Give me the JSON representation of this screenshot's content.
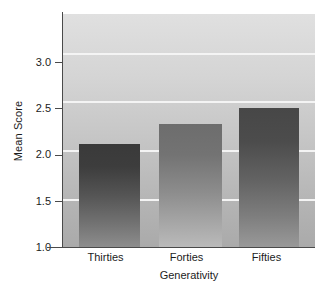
{
  "chart_data": {
    "type": "bar",
    "title": "",
    "subtitle": "",
    "xlabel": "Generativity",
    "ylabel": "Mean Score",
    "categories": [
      "Thirties",
      "Forties",
      "Fifties"
    ],
    "values": [
      2.06,
      2.27,
      2.43
    ],
    "series": [
      {
        "name": "Mean Score",
        "values": [
          2.06,
          2.27,
          2.43
        ]
      }
    ],
    "ylim": [
      1.0,
      3.4
    ],
    "yticks": [
      1.0,
      1.5,
      2.0,
      2.5,
      3.0
    ],
    "ytick_labels": [
      "1.0",
      "1.5",
      "2.0",
      "2.5",
      "3.0"
    ],
    "xlim_categories": 3,
    "grid": true,
    "grid_axis": "y",
    "grid_color": "#f4f4f4",
    "legend": false,
    "legend_position": "none",
    "plot_background": "gray-vertical-gradient",
    "bar_style": "vertical-gradient-dark-to-light",
    "bar_colors": [
      {
        "top": "#3b3b3b",
        "bottom": "#8d8d8d"
      },
      {
        "top": "#6e6e6e",
        "bottom": "#b9b9b9"
      },
      {
        "top": "#4a4a4a",
        "bottom": "#989898"
      }
    ],
    "axis_color": "#4a4a4a"
  },
  "axis": {
    "y_title": "Mean Score",
    "x_title": "Generativity"
  }
}
